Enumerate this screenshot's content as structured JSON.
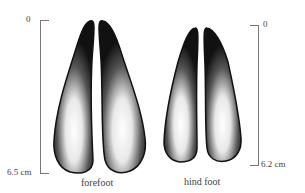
{
  "diagram": {
    "panels": [
      {
        "name": "forefoot",
        "caption": "forefoot",
        "scale": {
          "top_label": "0",
          "bottom_label": "6.5 cm"
        }
      },
      {
        "name": "hind-foot",
        "caption": "hind foot",
        "scale": {
          "top_label": "0",
          "bottom_label": "6.2 cm"
        }
      }
    ]
  }
}
